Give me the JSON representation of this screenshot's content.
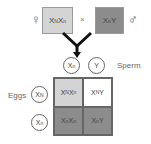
{
  "cross": {
    "female_symbol": "♀",
    "male_symbol": "♂",
    "times": "×",
    "female_genotype": {
      "a": "X",
      "a_sup": "N",
      "b": "X",
      "b_sup": "n"
    },
    "male_genotype": {
      "a": "X",
      "a_sup": "n",
      "b": "Y",
      "b_sup": ""
    }
  },
  "sperm": {
    "label": "Sperm",
    "gametes": [
      {
        "base": "X",
        "sup": "n"
      },
      {
        "base": "Y",
        "sup": ""
      }
    ]
  },
  "eggs": {
    "label": "Eggs",
    "gametes": [
      {
        "base": "X",
        "sup": "N"
      },
      {
        "base": "X",
        "sup": "n"
      }
    ]
  },
  "punnett": [
    {
      "a": "X",
      "a_sup": "N",
      "b": "X",
      "b_sup": "n",
      "shade": "light"
    },
    {
      "a": "X",
      "a_sup": "N",
      "b": "Y",
      "b_sup": "",
      "shade": "white"
    },
    {
      "a": "X",
      "a_sup": "n",
      "b": "X",
      "b_sup": "n",
      "shade": "dark"
    },
    {
      "a": "X",
      "a_sup": "n",
      "b": "Y",
      "b_sup": "",
      "shade": "dark"
    }
  ],
  "colors": {
    "light": "#d4d4d4",
    "dark": "#8c8c8c",
    "white": "#ffffff",
    "arrow": "#111111"
  }
}
